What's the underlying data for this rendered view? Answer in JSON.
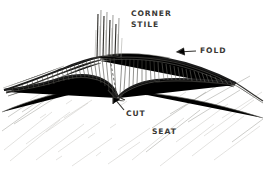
{
  "drawing": {
    "title": "Corner stile, fold, cut and seat joinery sketch",
    "medium": "hand-drawn pencil sketch",
    "background_color": "#ffffff",
    "ink_color": "#2b2b2b",
    "width": 265,
    "height": 169
  },
  "labels": {
    "corner_stile_line1": "CORNER",
    "corner_stile_line2": "STILE",
    "fold": "FOLD",
    "cut": "CUT",
    "seat": "SEAT"
  },
  "annotations": {
    "fold_arrow": "arrow-left",
    "cut_arrow": "arrow-up-left"
  },
  "parts": {
    "corner_stile": "bundle of vertical strokes rising from the fold ridge",
    "fold": "ridge line running across the top of the raised mound",
    "cut": "notch at the base of the stile where the seat is cut",
    "seat": "broad hatched plane in the lower half of the sketch"
  }
}
